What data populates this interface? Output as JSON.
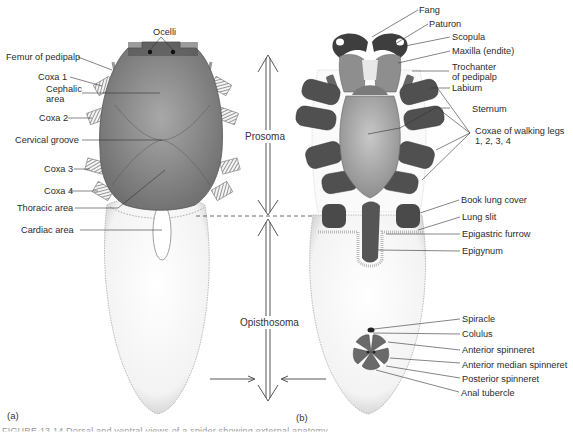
{
  "figure": {
    "panel_a_label": "(a)",
    "panel_b_label": "(b)",
    "caption_cutoff": "FIGURE 13.14 Dorsal and ventral views of a spider showing external anatomy"
  },
  "regions": {
    "prosoma": "Prosoma",
    "opisthosoma": "Opisthosoma"
  },
  "dorsal_labels": [
    {
      "id": "ocelli",
      "text": "Ocelli"
    },
    {
      "id": "femur-of-pedipalp",
      "text": "Femur of pedipalp"
    },
    {
      "id": "coxa-1",
      "text": "Coxa 1"
    },
    {
      "id": "cephalic-area",
      "text": "Cephalic\narea"
    },
    {
      "id": "coxa-2",
      "text": "Coxa 2"
    },
    {
      "id": "cervical-groove",
      "text": "Cervical groove"
    },
    {
      "id": "coxa-3",
      "text": "Coxa 3"
    },
    {
      "id": "coxa-4",
      "text": "Coxa 4"
    },
    {
      "id": "thoracic-area",
      "text": "Thoracic area"
    },
    {
      "id": "cardiac-area",
      "text": "Cardiac area"
    }
  ],
  "ventral_labels": [
    {
      "id": "fang",
      "text": "Fang"
    },
    {
      "id": "paturon",
      "text": "Paturon"
    },
    {
      "id": "scopula",
      "text": "Scopula"
    },
    {
      "id": "maxilla",
      "text": "Maxilla (endite)"
    },
    {
      "id": "trochanter",
      "text": "Trochanter\nof pedipalp"
    },
    {
      "id": "labium",
      "text": "Labium"
    },
    {
      "id": "sternum",
      "text": "Sternum"
    },
    {
      "id": "coxae-walking-legs",
      "text": "Coxae of walking legs\n1, 2, 3, 4"
    },
    {
      "id": "book-lung-cover",
      "text": "Book lung cover"
    },
    {
      "id": "lung-slit",
      "text": "Lung slit"
    },
    {
      "id": "epigastric-furrow",
      "text": "Epigastric furrow"
    },
    {
      "id": "epigynum",
      "text": "Epigynum"
    },
    {
      "id": "spiracle",
      "text": "Spiracle"
    },
    {
      "id": "colulus",
      "text": "Colulus"
    },
    {
      "id": "anterior-spinneret",
      "text": "Anterior spinneret"
    },
    {
      "id": "anterior-median-spinneret",
      "text": "Anterior median spinneret"
    },
    {
      "id": "posterior-spinneret",
      "text": "Posterior spinneret"
    },
    {
      "id": "anal-tubercle",
      "text": "Anal tubercle"
    }
  ],
  "colors": {
    "carapace": "#8a8a8a",
    "coxa_dark": "#5a5a5a",
    "abdomen": "#f4f4f4",
    "line": "#333333"
  }
}
